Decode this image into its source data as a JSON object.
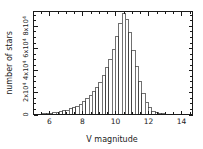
{
  "chart_data": {
    "type": "bar",
    "title": "",
    "subtitle": "",
    "xlabel": "V magnitude",
    "ylabel": "number of stars",
    "xlim": [
      5.03,
      14.67
    ],
    "ylim": [
      0,
      93000
    ],
    "grid": false,
    "legend": null,
    "bin_width": 0.2,
    "x_ticks": [
      6,
      8,
      10,
      12,
      14
    ],
    "x_tick_labels": [
      "6",
      "8",
      "10",
      "12",
      "14"
    ],
    "x_minor_tick_step": 0.5,
    "y_ticks": [
      0,
      20000,
      40000,
      60000,
      80000
    ],
    "y_tick_labels": [
      "0",
      "2x10",
      "4x10",
      "6x10",
      "8x10"
    ],
    "y_tick_exponents": [
      "",
      "4",
      "4",
      "4",
      "4"
    ],
    "y_minor_tick_step": 5000,
    "categories": [
      "5.1",
      "5.3",
      "5.5",
      "5.7",
      "5.9",
      "6.1",
      "6.3",
      "6.5",
      "6.7",
      "6.9",
      "7.1",
      "7.3",
      "7.5",
      "7.7",
      "7.9",
      "8.1",
      "8.3",
      "8.5",
      "8.7",
      "8.9",
      "9.1",
      "9.3",
      "9.5",
      "9.7",
      "9.9",
      "10.1",
      "10.3",
      "10.5",
      "10.7",
      "10.9",
      "11.1",
      "11.3",
      "11.5",
      "11.7",
      "11.9",
      "12.1",
      "12.3",
      "12.5",
      "12.7",
      "12.9",
      "13.1",
      "13.3",
      "13.5",
      "13.7",
      "13.9",
      "14.1",
      "14.3",
      "14.5"
    ],
    "values": [
      200,
      300,
      400,
      600,
      900,
      1200,
      1600,
      2000,
      2600,
      3200,
      4000,
      5000,
      6200,
      7600,
      9400,
      11500,
      14000,
      17000,
      20500,
      24500,
      29000,
      35000,
      42000,
      50000,
      59000,
      70000,
      82000,
      91000,
      86000,
      74000,
      58000,
      43000,
      30000,
      19000,
      11000,
      6000,
      3000,
      1500,
      900,
      600,
      420,
      320,
      260,
      200,
      180,
      150,
      130,
      110
    ]
  },
  "figure": {
    "background_color": "#ffffff",
    "line_color": "#1a1a1a",
    "bar_fill": "#ffffff",
    "bar_edge": "#333333"
  }
}
